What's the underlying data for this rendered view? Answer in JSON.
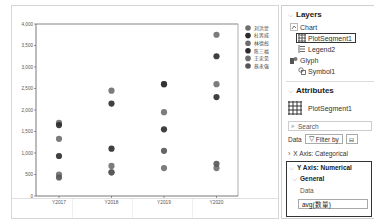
{
  "chart_data": {
    "type": "scatter",
    "title": "",
    "xlabel": "",
    "ylabel": "",
    "categories": [
      "Y2017",
      "Y2018",
      "Y2019",
      "Y2020"
    ],
    "ylim": [
      0,
      4000
    ],
    "yticks": [
      "0",
      "500",
      "1,000",
      "1,500",
      "2,000",
      "2,500",
      "3,000",
      "3,500",
      "4,000"
    ],
    "legend_position": "right",
    "series": [
      {
        "name": "刘洪蒙",
        "color": "#6e6e6e",
        "values": [
          1700,
          2450,
          2600,
          3750
        ]
      },
      {
        "name": "杜男威",
        "color": "#2b2b2b",
        "values": [
          1650,
          2150,
          2600,
          3250
        ]
      },
      {
        "name": "林德彪",
        "color": "#6e6e6e",
        "values": [
          1330,
          550,
          1950,
          2600
        ]
      },
      {
        "name": "陈三福",
        "color": "#2b2b2b",
        "values": [
          930,
          1100,
          1550,
          2300
        ]
      },
      {
        "name": "王忠见",
        "color": "#6e6e6e",
        "values": [
          500,
          700,
          650,
          650
        ]
      },
      {
        "name": "蔡永强",
        "color": "#555555",
        "values": [
          430,
          550,
          1050,
          750
        ]
      }
    ]
  },
  "legend": {
    "items": [
      "刘洪蒙",
      "杜男威",
      "林德彪",
      "陈三福",
      "王忠见",
      "蔡永强"
    ]
  },
  "panel": {
    "layers_title": "Layers",
    "layers": {
      "chart": "Chart",
      "plot_segment": "PlotSegment1",
      "legend": "Legend2",
      "glyph": "Glyph",
      "symbol": "Symbol1"
    },
    "attributes_title": "Attributes",
    "attributes_target": "PlotSegment1",
    "search_placeholder": "Search",
    "data_label": "Data",
    "filter_label": "Filter by",
    "x_axis_section": "X Axis: Categorical",
    "y_axis_section": "Y Axis: Numerical",
    "general_section": "General",
    "data_field_label": "Data",
    "data_field_value": "avg(数量)"
  }
}
